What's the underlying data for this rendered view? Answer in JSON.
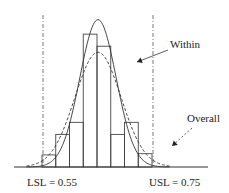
{
  "chart_data": {
    "type": "histogram",
    "title": "",
    "xlabel": "",
    "ylabel": "",
    "grid": false,
    "bins": [
      {
        "index": 1,
        "frequency": 1
      },
      {
        "index": 2,
        "frequency": 2.7
      },
      {
        "index": 3,
        "frequency": 3.7
      },
      {
        "index": 4,
        "frequency": 11
      },
      {
        "index": 5,
        "frequency": 10
      },
      {
        "index": 6,
        "frequency": 2.7
      },
      {
        "index": 7,
        "frequency": 3.7
      },
      {
        "index": 8,
        "frequency": 1.1
      }
    ],
    "x_range": [
      0.52,
      0.78
    ],
    "bin_edges": [
      0.55,
      0.575,
      0.6,
      0.625,
      0.65,
      0.675,
      0.7,
      0.725,
      0.75
    ],
    "curves": [
      {
        "name": "Within",
        "style": "solid",
        "mean": 0.65,
        "peak": 12.2,
        "sigma": 0.033
      },
      {
        "name": "Overall",
        "style": "dashed",
        "mean": 0.65,
        "peak": 9.5,
        "sigma": 0.042
      }
    ],
    "spec_limits": [
      {
        "name": "LSL",
        "label": "LSL = 0.55",
        "value": 0.55
      },
      {
        "name": "USL",
        "label": "USL = 0.75",
        "value": 0.75
      }
    ],
    "annotations": [
      {
        "text": "Within",
        "points_to": "Within"
      },
      {
        "text": "Overall",
        "points_to": "Overall"
      }
    ],
    "y_max": 13
  }
}
